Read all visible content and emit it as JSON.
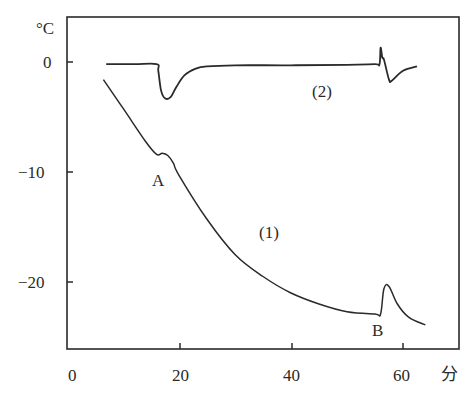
{
  "chart_data": {
    "type": "line",
    "title": "",
    "xlabel": "分",
    "ylabel": "°C",
    "xlim": [
      0,
      70
    ],
    "ylim": [
      -26,
      4
    ],
    "x_ticks": [
      "0",
      "20",
      "40",
      "60"
    ],
    "y_ticks": [
      "0",
      "-10",
      "-20"
    ],
    "grid": false,
    "series": [
      {
        "name": "(1)",
        "x": [
          6.5,
          10,
          14,
          16,
          17,
          18,
          19,
          20,
          25,
          30,
          35,
          40,
          45,
          50,
          55,
          56,
          56.6,
          57.5,
          59,
          61,
          64
        ],
        "y": [
          -1.6,
          -4.2,
          -7.2,
          -8.4,
          -8.3,
          -8.5,
          -9.2,
          -10.3,
          -14.3,
          -17.5,
          -19.5,
          -21.0,
          -22.0,
          -22.7,
          -22.9,
          -22.9,
          -20.6,
          -20.4,
          -22.0,
          -23.2,
          -23.9
        ]
      },
      {
        "name": "(2)",
        "x": [
          7,
          12,
          16,
          16.3,
          16.8,
          17.5,
          18.5,
          19.5,
          21,
          23,
          25,
          30,
          40,
          50,
          55,
          55.8,
          56,
          56.3,
          56.6,
          57.5,
          58,
          60,
          62.5
        ],
        "y": [
          -0.2,
          -0.2,
          -0.2,
          -0.8,
          -2.6,
          -3.3,
          -3.2,
          -2.3,
          -1.2,
          -0.6,
          -0.4,
          -0.3,
          -0.3,
          -0.25,
          -0.2,
          -0.2,
          1.3,
          0.4,
          0.2,
          -1.6,
          -1.7,
          -0.8,
          -0.4
        ]
      }
    ],
    "annotations": [
      {
        "text": "A",
        "x": 16.5,
        "y": -10.6
      },
      {
        "text": "B",
        "x": 55,
        "y": -24.3
      },
      {
        "text": "(1)",
        "x": 35.5,
        "y": -15.5
      },
      {
        "text": "(2)",
        "x": 45.5,
        "y": -2.6
      }
    ]
  }
}
